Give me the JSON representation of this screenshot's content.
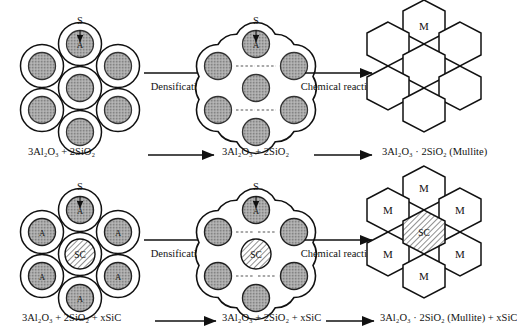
{
  "figure": {
    "type": "process-diagram",
    "rows": 2,
    "columns": 3,
    "background_color": "#ffffff",
    "line_color": "#111111",
    "core_fill": "#a9a9a9",
    "shell_fill": "#ffffff",
    "sic_fill": "#ffffff"
  },
  "labels": {
    "shell_pointer": "S",
    "core_letter": "A",
    "sic_letter": "SC",
    "mullite_letter": "M"
  },
  "process_arrows": {
    "densification": "Densification",
    "chemical_reaction": "Chemical reaction"
  },
  "row_top": {
    "stage1": {
      "name": "coated-particles",
      "pointer_label": "S",
      "formula_parts": [
        "3Al",
        "2",
        "O",
        "3",
        " + 2SiO",
        "2"
      ],
      "formula_text": "3Al2O3 + 2SiO2",
      "particle_count": 7,
      "core_letters": [
        "A",
        "A",
        "A",
        "A",
        "A",
        "A",
        "A"
      ]
    },
    "stage2": {
      "name": "densified-particles",
      "pointer_label": "S",
      "formula_text": "3Al2O3 + 2SiO2",
      "particle_count": 7
    },
    "stage3": {
      "name": "mullite-honeycomb",
      "formula_text": "3Al2O3 · 2SiO2 (Mullite)",
      "hexagon_count": 7,
      "labeled_hexagons": [
        "M"
      ]
    }
  },
  "row_bottom": {
    "stage1": {
      "name": "coated-particles-with-sic",
      "pointer_label": "S",
      "formula_text": "3Al2O3 + 2SiO2 + xSiC",
      "particle_count": 7,
      "center_particle": "SC",
      "outer_core_letters": [
        "A",
        "A",
        "A",
        "A",
        "A",
        "A"
      ]
    },
    "stage2": {
      "name": "densified-particles-with-sic",
      "pointer_label": "S",
      "formula_text": "3Al2O3 + 2SiO2 + xSiC",
      "particle_count": 7,
      "center_particle": "SC"
    },
    "stage3": {
      "name": "mullite-honeycomb-with-sic",
      "formula_text": "3Al2O3 · 2SiO2 (Mullite) + xSiC",
      "hexagon_count": 7,
      "center_hexagon": "SC",
      "labeled_hexagons": [
        "M",
        "M",
        "M",
        "M",
        "M",
        "M"
      ]
    }
  },
  "formulas": {
    "top_left": "3Al₂O₃ + 2SiO₂",
    "top_mid": "3Al₂O₃ + 2SiO₂",
    "top_right": "3Al₂O₃ · 2SiO₂ (Mullite)",
    "bottom_left": "3Al₂O₃ + 2SiO₂ + xSiC",
    "bottom_mid": "3Al₂O₃ + 2SiO₂ + xSiC",
    "bottom_right": "3Al₂O₃ · 2SiO₂ (Mullite) + xSiC"
  }
}
